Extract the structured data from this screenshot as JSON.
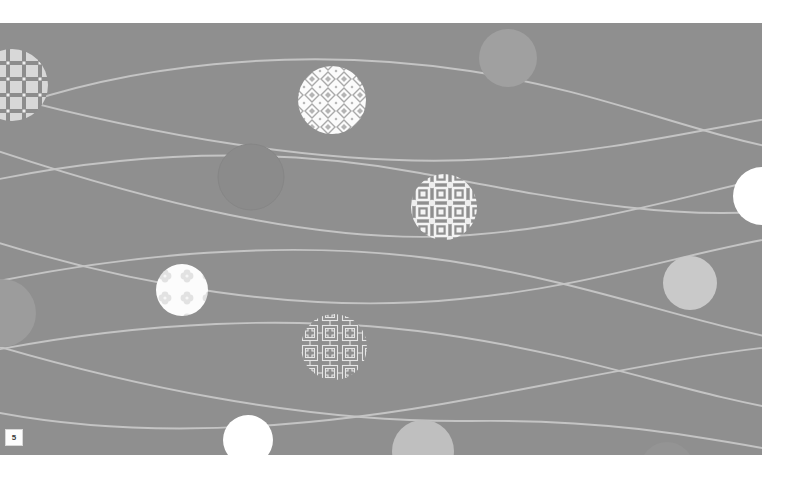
{
  "slide": {
    "background_color": "#8f8f8f",
    "canvas": {
      "x": 0,
      "y": 23,
      "width": 762,
      "height": 432
    },
    "page_number": "5",
    "line_color": "#c4c4c4",
    "wave_lines": [
      {
        "name": "wave-line-1",
        "path": "M -20 96 C 120 40, 300 22, 470 48 C 600 68, 690 110, 790 128"
      },
      {
        "name": "wave-line-2",
        "path": "M -20 160 C 110 132, 260 120, 420 150 C 560 176, 680 200, 790 186"
      },
      {
        "name": "wave-line-3",
        "path": "M -20 122 C 140 176, 320 224, 470 212 C 600 202, 700 168, 790 150"
      },
      {
        "name": "wave-line-4",
        "path": "M -20 214 C 130 262, 300 292, 460 276 C 590 264, 690 228, 790 212"
      },
      {
        "name": "wave-line-5",
        "path": "M -20 262 C 120 232, 290 214, 450 238 C 590 260, 690 300, 790 318"
      },
      {
        "name": "wave-line-6",
        "path": "M -20 330 C 130 300, 300 288, 460 314 C 600 336, 690 372, 790 388"
      },
      {
        "name": "wave-line-7",
        "path": "M -20 386 C 140 420, 320 404, 470 376 C 600 352, 700 330, 790 322"
      },
      {
        "name": "wave-line-8",
        "path": "M -20 318 C 120 360, 300 400, 470 398 C 610 396, 700 414, 790 430"
      },
      {
        "name": "wave-line-9",
        "path": "M -20 66 C 140 110, 330 146, 490 136 C 620 128, 700 106, 790 92"
      }
    ],
    "solid_circles": [
      {
        "name": "solid-circle-top-right",
        "cx": 508,
        "cy": 35,
        "r": 29,
        "fill": "#a0a0a0"
      },
      {
        "name": "solid-circle-outline-mid-left",
        "cx": 251,
        "cy": 154,
        "r": 33,
        "fill": "#8b8b8b",
        "stroke": "#868686"
      },
      {
        "name": "solid-circle-right-white",
        "cx": 762,
        "cy": 173,
        "r": 29,
        "fill": "#ffffff"
      },
      {
        "name": "solid-circle-right-light",
        "cx": 690,
        "cy": 260,
        "r": 27,
        "fill": "#c9c9c9"
      },
      {
        "name": "solid-circle-left-light",
        "cx": 2,
        "cy": 290,
        "r": 34,
        "fill": "#9c9c9c"
      },
      {
        "name": "solid-circle-bottom-white",
        "cx": 248,
        "cy": 417,
        "r": 25,
        "fill": "#ffffff"
      },
      {
        "name": "solid-circle-bottom-light",
        "cx": 423,
        "cy": 428,
        "r": 31,
        "fill": "#bfbfbf"
      },
      {
        "name": "solid-circle-bottom-faint",
        "cx": 667,
        "cy": 446,
        "r": 27,
        "fill": "#949494"
      }
    ],
    "pattern_circles": [
      {
        "name": "pattern-circle-left-edge",
        "cx": 12,
        "cy": 62,
        "r": 36,
        "pattern": "cross-grid",
        "description": "cross and plus motif lattice"
      },
      {
        "name": "pattern-circle-diamond",
        "cx": 332,
        "cy": 77,
        "r": 34,
        "pattern": "diamond-lattice",
        "description": "white field with gray diamond lattice"
      },
      {
        "name": "pattern-circle-square-floral",
        "cx": 444,
        "cy": 184,
        "r": 33,
        "pattern": "square-floral",
        "description": "gray field with white square and floral ornaments"
      },
      {
        "name": "pattern-circle-quatrefoil",
        "cx": 182,
        "cy": 267,
        "r": 26,
        "pattern": "quatrefoil",
        "description": "white field with faint clover motifs"
      },
      {
        "name": "pattern-circle-fretwork",
        "cx": 334,
        "cy": 324,
        "r": 33,
        "pattern": "fretwork",
        "description": "thin white maze and key fret lines"
      },
      {
        "name": "pattern-circle-interlock",
        "cx": 516,
        "cy": 312,
        "r": 29,
        "pattern": "interlock-cross",
        "description": "interlocking cross lattice"
      }
    ]
  }
}
